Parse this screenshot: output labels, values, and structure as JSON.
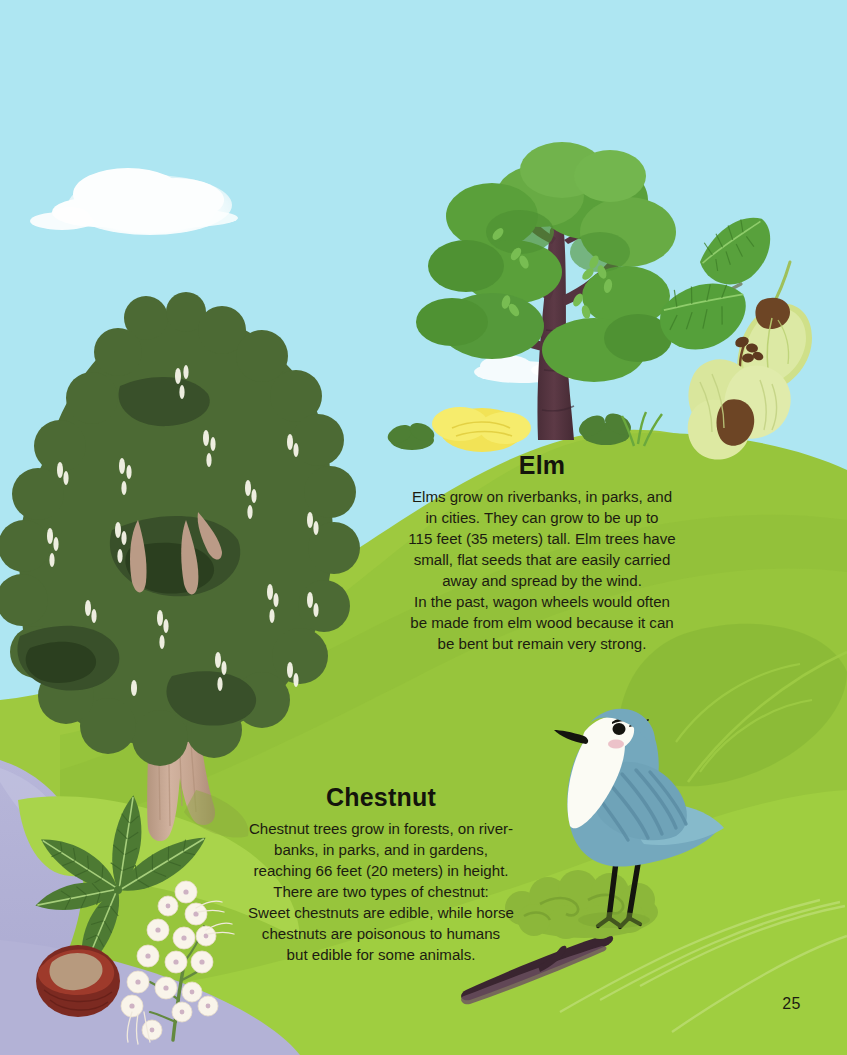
{
  "page": {
    "number": "25",
    "width": 847,
    "height": 1055
  },
  "palette": {
    "sky": "#aee6f2",
    "cloud": "#ffffff",
    "hill_light": "#9fcb42",
    "hill_mid": "#93c23c",
    "hill_dark": "#86b437",
    "hill_shadow": "#7fae36",
    "river": "#b3b2d6",
    "chestnut_canopy": "#4e6b36",
    "chestnut_canopy_dark": "#3c5429",
    "chestnut_canopy_deep": "#2c3f1e",
    "chestnut_trunk": "#c9a894",
    "elm_trunk": "#54343f",
    "elm_foliage": "#63a33e",
    "elm_foliage_dark": "#4d8a32",
    "elm_leaf": "#5faa3c",
    "samara": "#dfe8a0",
    "seed_brown": "#6b4526",
    "bird_blue": "#74a8bd",
    "bird_blue_dark": "#5d93a9",
    "bird_white": "#fbfbf6",
    "bird_black": "#14140f",
    "conker_brown": "#7e2b22",
    "conker_patch": "#b79a7e",
    "flower_white": "#fbf6ef",
    "yellow_bush": "#f2e356",
    "text": "#1c1c10"
  },
  "elm": {
    "heading": "Elm",
    "body_lines": [
      "Elms grow on riverbanks, in parks, and",
      "in cities. They can grow to be up to",
      "115 feet (35 meters) tall. Elm trees have",
      "small, flat seeds that are easily carried",
      "away and spread by the wind.",
      "In the past, wagon wheels would often",
      "be made from elm wood because it can",
      "be bent but remain very strong."
    ],
    "body": "Elms grow on riverbanks, in parks, and in cities. They can grow to be up to 115 feet (35 meters) tall. Elm trees have small, flat seeds that are easily carried away and spread by the wind. In the past, wagon wheels would often be made from elm wood because it can be bent but remain very strong."
  },
  "chestnut": {
    "heading": "Chestnut",
    "body_lines": [
      "Chestnut trees grow in forests, on river-",
      "banks, in parks, and in gardens,",
      "reaching 66 feet (20 meters) in height.",
      "There are two types of chestnut:",
      "Sweet chestnuts are edible, while horse",
      "chestnuts are poisonous to humans",
      "but edible for some animals."
    ],
    "body": "Chestnut trees grow in forests, on riverbanks, in parks, and in gardens, reaching 66 feet (20 meters) in height. There are two types of chestnut: Sweet chestnuts are edible, while horse chestnuts are poisonous to humans but edible for some animals."
  },
  "illustration": {
    "sky_label": "sky",
    "cloud_large_label": "large cloud",
    "cloud_small_label": "small cloud",
    "elm_tree_label": "elm tree",
    "chestnut_tree_label": "horse chestnut tree",
    "elm_leaf_label": "elm leaf spray",
    "elm_samara_label": "elm winged seeds",
    "chestnut_leaf_label": "chestnut palmate leaf",
    "chestnut_flower_label": "chestnut flower spike",
    "conker_label": "chestnut conker",
    "bird_label": "blue songbird",
    "river_label": "river",
    "branch_label": "fallen branch",
    "yellow_bush_label": "yellow flowering bush"
  }
}
